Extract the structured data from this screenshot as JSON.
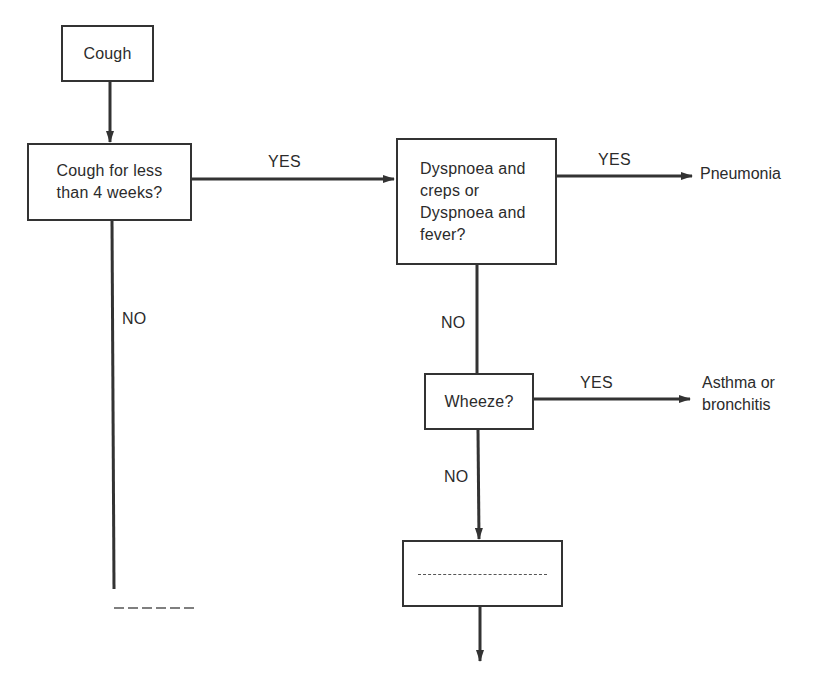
{
  "diagram": {
    "type": "flowchart",
    "nodes": {
      "start": {
        "label": "Cough"
      },
      "duration_check": {
        "label": "Cough for less\nthan 4 weeks?"
      },
      "dyspnoea_check": {
        "label": "Dyspnoea and\ncreps or\nDyspnoea and\nfever?"
      },
      "wheeze_check": {
        "label": "Wheeze?"
      },
      "next_step": {
        "label": ""
      }
    },
    "outcomes": {
      "pneumonia": "Pneumonia",
      "asthma_bronchitis": "Asthma or\nbronchitis"
    },
    "edge_labels": {
      "duration_yes": "YES",
      "duration_no": "NO",
      "dyspnoea_yes": "YES",
      "dyspnoea_no": "NO",
      "wheeze_yes": "YES",
      "wheeze_no": "NO"
    },
    "edges": [
      {
        "from": "start",
        "to": "duration_check",
        "label": ""
      },
      {
        "from": "duration_check",
        "to": "dyspnoea_check",
        "label": "YES"
      },
      {
        "from": "duration_check",
        "to": "continued (dashed)",
        "label": "NO"
      },
      {
        "from": "dyspnoea_check",
        "to": "pneumonia",
        "label": "YES"
      },
      {
        "from": "dyspnoea_check",
        "to": "wheeze_check",
        "label": "NO"
      },
      {
        "from": "wheeze_check",
        "to": "asthma_bronchitis",
        "label": "YES"
      },
      {
        "from": "wheeze_check",
        "to": "next_step",
        "label": "NO"
      },
      {
        "from": "next_step",
        "to": "continued",
        "label": ""
      }
    ],
    "colors": {
      "line": "#333333",
      "text": "#2b2b2b",
      "background": "#ffffff"
    }
  }
}
